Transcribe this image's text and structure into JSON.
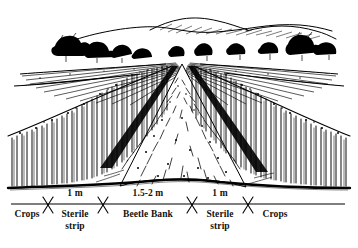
{
  "figure": {
    "style": "pen-and-ink line drawing",
    "ink_color": "#000000",
    "background_color": "#ffffff"
  },
  "scene": {
    "horizon_label": "rolling farmland with hedgerow trees",
    "vanishing_point": {
      "x": 183,
      "y": 62
    },
    "elements": [
      {
        "name": "distant-hills",
        "description": "rolling hills on skyline"
      },
      {
        "name": "hedgerow-trees",
        "description": "trees and hedgerows along horizon"
      },
      {
        "name": "distant-fields",
        "description": "hatched ploughed fields"
      },
      {
        "name": "left-crop-block",
        "description": "standing crop, vertical hatching"
      },
      {
        "name": "right-crop-block",
        "description": "standing crop, vertical hatching"
      },
      {
        "name": "left-sterile-strip",
        "description": "bare uncultivated strip"
      },
      {
        "name": "right-sterile-strip",
        "description": "bare uncultivated strip"
      },
      {
        "name": "beetle-bank-mound",
        "description": "raised tussocky grass ridge"
      },
      {
        "name": "ground-line",
        "description": "foreground soil line"
      }
    ]
  },
  "scale_bar": {
    "axis_start_x": 11,
    "axis_end_x": 345,
    "axis_y": 16,
    "ticks": [
      48,
      103,
      192,
      248
    ],
    "dimensions": [
      {
        "label": "1 m",
        "center_x": 75,
        "span": [
          48,
          103
        ]
      },
      {
        "label": "1.5-2 m",
        "center_x": 148,
        "span": [
          103,
          192
        ]
      },
      {
        "label": "1 m",
        "center_x": 220,
        "span": [
          192,
          248
        ]
      }
    ],
    "segments": [
      {
        "label": "Crops",
        "center_x": 27,
        "lines": [
          "Crops"
        ]
      },
      {
        "label": "Sterile strip",
        "center_x": 75,
        "lines": [
          "Sterile",
          "strip"
        ]
      },
      {
        "label": "Beetle Bank",
        "center_x": 148,
        "lines": [
          "Beetle Bank"
        ]
      },
      {
        "label": "Sterile strip",
        "center_x": 220,
        "lines": [
          "Sterile",
          "strip"
        ]
      },
      {
        "label": "Crops",
        "center_x": 274,
        "lines": [
          "Crops"
        ]
      }
    ]
  }
}
